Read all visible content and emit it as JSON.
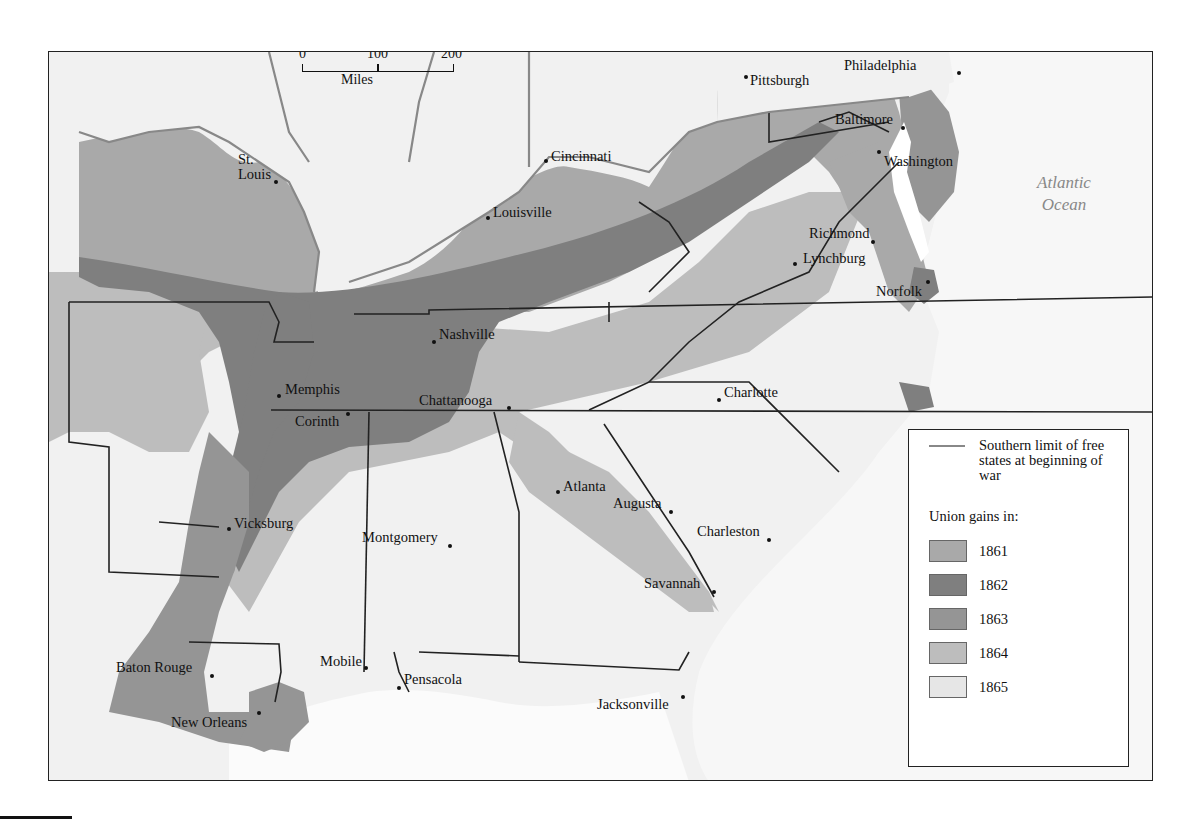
{
  "colors": {
    "g1861": "#a9a9a9",
    "g1862": "#7f7f7f",
    "g1863": "#959595",
    "g1864": "#bdbdbd",
    "g1865": "#e6e6e6",
    "land": "#f1f1f1",
    "water": "#ffffff",
    "free_state_line": "#888888",
    "border": "#222222"
  },
  "scale": {
    "ticks": [
      "0",
      "100",
      "200"
    ],
    "unit": "Miles"
  },
  "ocean": {
    "line1": "Atlantic",
    "line2": "Ocean"
  },
  "cities": [
    {
      "name": "Pittsburgh",
      "x": 697,
      "y": 25,
      "dx": 4,
      "dy": -4
    },
    {
      "name": "Philadelphia",
      "x": 910,
      "y": 21,
      "dx": -115,
      "dy": -15
    },
    {
      "name": "Baltimore",
      "x": 854,
      "y": 76,
      "dx": -68,
      "dy": -16
    },
    {
      "name": "Washington",
      "x": 830,
      "y": 100,
      "dx": 5,
      "dy": 2
    },
    {
      "name": "St.\nLouis",
      "x": 227,
      "y": 130,
      "dx": -38,
      "dy": -30
    },
    {
      "name": "Cincinnati",
      "x": 497,
      "y": 109,
      "dx": 5,
      "dy": -12
    },
    {
      "name": "Louisville",
      "x": 439,
      "y": 166,
      "dx": 5,
      "dy": -13
    },
    {
      "name": "Richmond",
      "x": 824,
      "y": 190,
      "dx": -64,
      "dy": -16
    },
    {
      "name": "Lynchburg",
      "x": 746,
      "y": 212,
      "dx": 8,
      "dy": -13
    },
    {
      "name": "Norfolk",
      "x": 879,
      "y": 230,
      "dx": -52,
      "dy": 2
    },
    {
      "name": "Nashville",
      "x": 385,
      "y": 290,
      "dx": 5,
      "dy": -15
    },
    {
      "name": "Memphis",
      "x": 230,
      "y": 344,
      "dx": 6,
      "dy": -14
    },
    {
      "name": "Chattanooga",
      "x": 460,
      "y": 356,
      "dx": -90,
      "dy": -15
    },
    {
      "name": "Corinth",
      "x": 299,
      "y": 362,
      "dx": -53,
      "dy": 0
    },
    {
      "name": "Charlotte",
      "x": 670,
      "y": 348,
      "dx": 5,
      "dy": -15
    },
    {
      "name": "Atlanta",
      "x": 509,
      "y": 440,
      "dx": 5,
      "dy": -13
    },
    {
      "name": "Augusta",
      "x": 622,
      "y": 460,
      "dx": -58,
      "dy": -16
    },
    {
      "name": "Charleston",
      "x": 720,
      "y": 488,
      "dx": -72,
      "dy": -16
    },
    {
      "name": "Vicksburg",
      "x": 180,
      "y": 477,
      "dx": 5,
      "dy": -13
    },
    {
      "name": "Montgomery",
      "x": 401,
      "y": 494,
      "dx": -88,
      "dy": -16
    },
    {
      "name": "Savannah",
      "x": 665,
      "y": 540,
      "dx": -70,
      "dy": -16
    },
    {
      "name": "Baton Rouge",
      "x": 163,
      "y": 624,
      "dx": -96,
      "dy": -16
    },
    {
      "name": "Mobile",
      "x": 317,
      "y": 616,
      "dx": -46,
      "dy": -14
    },
    {
      "name": "Pensacola",
      "x": 350,
      "y": 636,
      "dx": 5,
      "dy": -16
    },
    {
      "name": "New Orleans",
      "x": 210,
      "y": 661,
      "dx": -88,
      "dy": 2
    },
    {
      "name": "Jacksonville",
      "x": 634,
      "y": 645,
      "dx": -86,
      "dy": 0
    }
  ],
  "legend": {
    "line_label": "Southern limit of free states at beginning of war",
    "heading": "Union gains in:",
    "items": [
      {
        "year": "1861",
        "color": "#a9a9a9"
      },
      {
        "year": "1862",
        "color": "#7f7f7f"
      },
      {
        "year": "1863",
        "color": "#959595"
      },
      {
        "year": "1864",
        "color": "#bdbdbd"
      },
      {
        "year": "1865",
        "color": "#e6e6e6"
      }
    ]
  }
}
